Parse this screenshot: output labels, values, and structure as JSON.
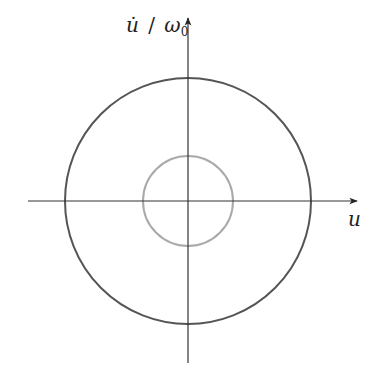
{
  "diagram": {
    "type": "phase-portrait",
    "axes": {
      "x_label": "u",
      "y_label_numerator": "u̇",
      "y_label_slash": "/",
      "y_label_denominator": "ω",
      "y_label_subscript": "0"
    },
    "origin": {
      "x": 188,
      "y": 201
    },
    "curves": [
      {
        "name": "outer-orbit",
        "radius": 123,
        "color": "#555555"
      },
      {
        "name": "inner-orbit",
        "radius": 45,
        "color": "#aaaaaa"
      }
    ],
    "colors": {
      "axis": "#333333"
    }
  }
}
